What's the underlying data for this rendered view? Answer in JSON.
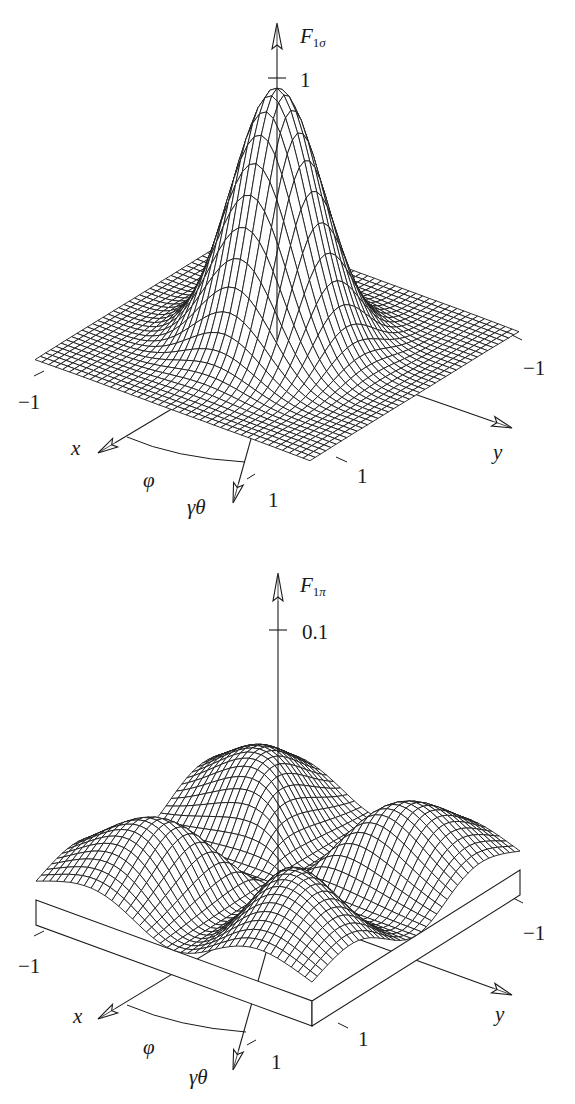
{
  "figure": {
    "ink_color": "#1a1a1a",
    "background": "#ffffff"
  },
  "panels": [
    {
      "id": "top",
      "z_axis_label": {
        "main": "F",
        "sub_num": "1",
        "sub_greek": "σ"
      },
      "z_tick_label": "1",
      "x_axis_label": "x",
      "y_axis_label": "y",
      "phi_label": "φ",
      "gamma_theta_label": "γθ",
      "x_tick_minus": "−1",
      "x_tick_plus": "1",
      "y_tick_minus": "−1",
      "y_tick_plus": "1"
    },
    {
      "id": "bottom",
      "z_axis_label": {
        "main": "F",
        "sub_num": "1",
        "sub_greek": "π"
      },
      "z_tick_label": "0.1",
      "x_axis_label": "x",
      "y_axis_label": "y",
      "phi_label": "φ",
      "gamma_theta_label": "γθ",
      "x_tick_minus": "−1",
      "x_tick_plus": "1",
      "y_tick_minus": "−1",
      "y_tick_plus": "1"
    }
  ],
  "chart_data": [
    {
      "type": "surface",
      "title": "F_1σ",
      "xlabel": "x",
      "ylabel": "y",
      "zlabel": "F_1σ",
      "x_range": [
        -1,
        1
      ],
      "y_range": [
        -1,
        1
      ],
      "z_ticks": [
        1
      ],
      "z_range": [
        0,
        1
      ],
      "angle_labels": [
        "φ",
        "γθ"
      ],
      "description": "Single central peak of height ≈1 at x=y=0, decaying to ≈0 at the edges of the [-1,1]×[-1,1] domain (wireframe mesh)",
      "peak": {
        "x": 0,
        "y": 0,
        "z": 0.95
      },
      "grid_lines": 40
    },
    {
      "type": "surface",
      "title": "F_1π",
      "xlabel": "x",
      "ylabel": "y",
      "zlabel": "F_1π",
      "x_range": [
        -1,
        1
      ],
      "y_range": [
        -1,
        1
      ],
      "z_ticks": [
        0.1
      ],
      "z_range": [
        0,
        0.1
      ],
      "angle_labels": [
        "φ",
        "γθ"
      ],
      "description": "Four-lobed pattern: zero at center and along the x and y axes, four hills along the diagonals (max ≈0.03), drawn on a base slab",
      "lobe_max": 0.03,
      "grid_lines": 40
    }
  ]
}
